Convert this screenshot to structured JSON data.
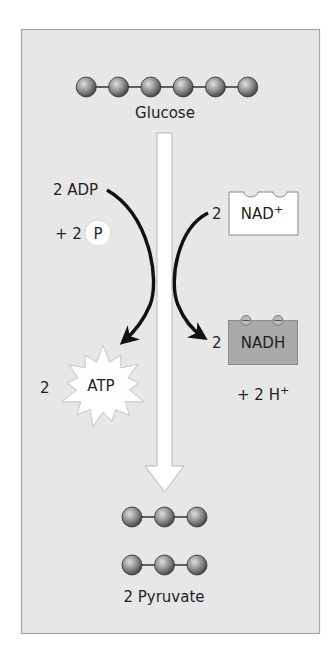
{
  "colors": {
    "panel_bg": "#e7e7e7",
    "panel_border": "#a7a7a7",
    "shaft_fill": "#ffffff",
    "shaft_border": "#b5b5b5",
    "arc_color": "#111111",
    "text": "#231f20",
    "nad_box_fill": "#ffffff",
    "nadh_box_fill": "#a9a9a9",
    "box_border": "#8a8a8a",
    "ball_light": "#c9c9c9",
    "ball_dark": "#4a4a4a",
    "starburst_fill": "#ffffff",
    "starburst_border": "#cfcfcf"
  },
  "glucose": {
    "label": "Glucose",
    "carbon_count": 6
  },
  "pyruvate": {
    "label": "2 Pyruvate",
    "molecules": 2,
    "carbon_count": 3
  },
  "left_reaction": {
    "input_label": "2 ADP",
    "plus_label": "+ 2",
    "phosphate_label": "P",
    "output_coefficient": "2",
    "output_label": "ATP"
  },
  "right_reaction": {
    "input_coefficient": "2",
    "input_label": "NAD",
    "input_superscript": "+",
    "output_coefficient": "2",
    "output_label": "NADH",
    "byproduct_label": "+ 2 H",
    "byproduct_superscript": "+"
  }
}
